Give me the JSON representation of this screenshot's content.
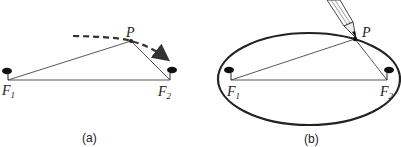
{
  "panels": [
    {
      "caption": "(a)",
      "labels": {
        "f1": "F",
        "f1_sub": "1",
        "f2": "F",
        "f2_sub": "2",
        "p": "P"
      },
      "description": "Two pins at foci F1 and F2 with string forming triangle to point P; dashed arrow shows motion of P"
    },
    {
      "caption": "(b)",
      "labels": {
        "f1": "F",
        "f1_sub": "1",
        "f2": "F",
        "f2_sub": "2",
        "p": "P"
      },
      "description": "Pencil at P traces an ellipse around foci F1 and F2 with taut string"
    }
  ],
  "colors": {
    "line": "#333333",
    "ellipse": "#222222",
    "pin": "#111111",
    "dash": "#333333"
  }
}
